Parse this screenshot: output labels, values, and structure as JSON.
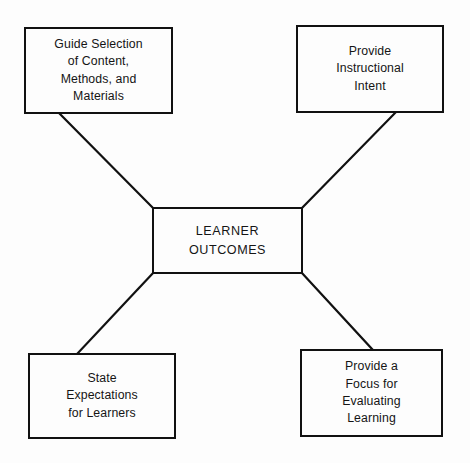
{
  "diagram": {
    "background_color": "#fdfdfd",
    "line_color": "#111111",
    "text_color": "#151515",
    "center": {
      "id": "learner-outcomes",
      "label": "LEARNER\nOUTCOMES"
    },
    "nodes": [
      {
        "id": "guide-selection",
        "label": "Guide Selection\nof Content,\nMethods, and\nMaterials",
        "position": "top-left"
      },
      {
        "id": "instructional-intent",
        "label": "Provide\nInstructional\nIntent",
        "position": "top-right"
      },
      {
        "id": "state-expectations",
        "label": "State\nExpectations\nfor Learners",
        "position": "bottom-left"
      },
      {
        "id": "evaluating-learning",
        "label": "Provide a\nFocus for\nEvaluating\nLearning",
        "position": "bottom-right"
      }
    ],
    "connectors": [
      {
        "id": "connector-top-left",
        "from": "guide-selection",
        "to": "learner-outcomes",
        "x1": 59,
        "y1": 113,
        "x2": 153,
        "y2": 208
      },
      {
        "id": "connector-top-right",
        "from": "instructional-intent",
        "to": "learner-outcomes",
        "x1": 396,
        "y1": 112,
        "x2": 302,
        "y2": 208
      },
      {
        "id": "connector-bottom-left",
        "from": "state-expectations",
        "to": "learner-outcomes",
        "x1": 78,
        "y1": 353,
        "x2": 153,
        "y2": 273
      },
      {
        "id": "connector-bottom-right",
        "from": "evaluating-learning",
        "to": "learner-outcomes",
        "x1": 372,
        "y1": 349,
        "x2": 302,
        "y2": 273
      }
    ]
  }
}
